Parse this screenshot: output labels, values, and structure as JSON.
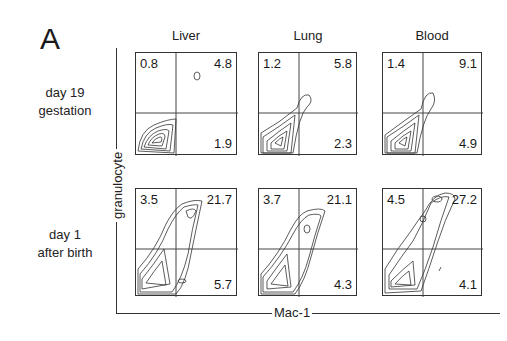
{
  "figure": {
    "panel_letter": "A",
    "x_axis_label": "Mac-1",
    "y_axis_label": "granulocyte",
    "columns": [
      "Liver",
      "Lung",
      "Blood"
    ],
    "rows": [
      {
        "label_line1": "day 19",
        "label_line2": "gestation"
      },
      {
        "label_line1": "day 1",
        "label_line2": "after birth"
      }
    ],
    "tick_labels": [
      "10⁰",
      "10¹",
      "10²",
      "10³",
      "10⁴"
    ],
    "quadrants": [
      [
        {
          "ul": "0.8",
          "ur": "4.8",
          "lr": "1.9"
        },
        {
          "ul": "1.2",
          "ur": "5.8",
          "lr": "2.3"
        },
        {
          "ul": "1.4",
          "ur": "9.1",
          "lr": "4.9"
        }
      ],
      [
        {
          "ul": "3.5",
          "ur": "21.7",
          "lr": "5.7"
        },
        {
          "ul": "3.7",
          "ur": "21.1",
          "lr": "4.3"
        },
        {
          "ul": "4.5",
          "ur": "27.2",
          "lr": "4.1"
        }
      ]
    ]
  }
}
